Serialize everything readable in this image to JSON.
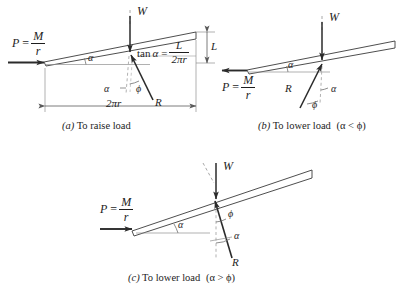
{
  "figure": {
    "type": "engineering-free-body-diagram",
    "background_color": "#ffffff",
    "line_color": "#3a3a3a",
    "vector_color": "#2b2b2b",
    "dashed_color": "#9a9a9a",
    "text_color": "#1d1d1d"
  },
  "panels": [
    {
      "id": "a",
      "caption_index": "(a)",
      "caption_text": "To raise load",
      "caption_condition": "",
      "force_P": {
        "label_lead": "P",
        "equals": "=",
        "numerator": "M",
        "denominator": "r",
        "direction": "right"
      },
      "force_W": {
        "label": "W",
        "direction": "down"
      },
      "force_R": {
        "label": "R",
        "direction": "down-right"
      },
      "angle_alpha": "α",
      "angle_phi": "ϕ",
      "relation": {
        "lhs_fn": "tan",
        "lhs_arg": "α",
        "equals": "=",
        "numerator": "L",
        "denominator": "2πr"
      },
      "dimension_lead": "L",
      "dimension_base": "2πr"
    },
    {
      "id": "b",
      "caption_index": "(b)",
      "caption_text": "To lower load",
      "caption_condition": "(α < ϕ)",
      "force_P": {
        "label_lead": "P",
        "equals": "=",
        "numerator": "M",
        "denominator": "r",
        "direction": "left"
      },
      "force_W": {
        "label": "W",
        "direction": "down"
      },
      "force_R": {
        "label": "R",
        "direction": "up-right"
      },
      "angle_alpha": "α",
      "angle_phi": "ϕ"
    },
    {
      "id": "c",
      "caption_index": "(c)",
      "caption_text": "To lower load",
      "caption_condition": "(α > ϕ)",
      "force_P": {
        "label_lead": "P",
        "equals": "=",
        "numerator": "M",
        "denominator": "r",
        "direction": "right"
      },
      "force_W": {
        "label": "W",
        "direction": "down"
      },
      "force_R": {
        "label": "R",
        "direction": "up-left"
      },
      "angle_alpha": "α",
      "angle_phi": "ϕ"
    }
  ]
}
